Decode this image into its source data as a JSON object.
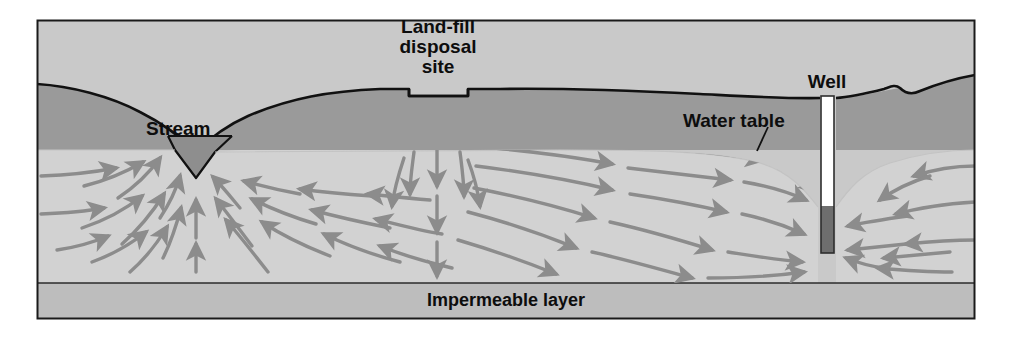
{
  "figure": {
    "kind": "cross-section-diagram",
    "frame": {
      "x": 37,
      "y": 20,
      "width": 938,
      "height": 299,
      "border_color": "#1a1a1a"
    }
  },
  "labels": {
    "stream": "Stream",
    "landfill_line1": "Land-fill",
    "landfill_line2": "disposal",
    "landfill_line3": "site",
    "well": "Well",
    "water_table": "Water table",
    "impermeable_layer": "Impermeable layer"
  },
  "layers": [
    {
      "name": "sky",
      "label": "",
      "color": "#c9c9c9"
    },
    {
      "name": "unsaturated-zone",
      "label": "",
      "color": "#9a9a9a"
    },
    {
      "name": "saturated-zone",
      "label": "",
      "color": "#d2d2d2"
    },
    {
      "name": "impermeable-layer",
      "label": "Impermeable layer",
      "color": "#bdbdbd"
    }
  ],
  "colors": {
    "sky": "#c9c9c9",
    "unsaturated_zone": "#9a9a9a",
    "saturated_zone": "#d2d2d2",
    "impermeable_layer": "#bdbdbd",
    "ground_line": "#111111",
    "arrow": "#8c8c8c",
    "stream_water": "#8e8e8e",
    "well_casing": "#ffffff",
    "well_water": "#6e6e6e",
    "text": "#0d0d0d",
    "frame_border": "#1a1a1a",
    "page_background": "#ffffff"
  },
  "features": {
    "stream": {
      "name": "stream",
      "x": 196,
      "surface_y": 136
    },
    "landfill": {
      "name": "land-fill-disposal-site",
      "x_left": 409,
      "x_right": 468,
      "floor_y": 96
    },
    "well": {
      "name": "well",
      "x": 827,
      "top_y": 96,
      "bottom_y": 253,
      "water_top_y": 206,
      "width": 13
    },
    "water_table": {
      "name": "water-table",
      "leader_from_x": 768,
      "leader_from_y": 128,
      "leader_to_x": 757,
      "leader_to_y": 150
    }
  },
  "flow_arrows": {
    "description": "Groundwater flow direction arrows in the saturated zone",
    "color": "#8c8c8c",
    "groups": [
      {
        "name": "left-recharge-to-stream",
        "direction": "right-and-up toward stream",
        "count": 9
      },
      {
        "name": "stream-discharge-upward",
        "direction": "upward into stream bed",
        "count": 3
      },
      {
        "name": "stream-to-landfill-divide",
        "direction": "left toward stream",
        "count": 10
      },
      {
        "name": "landfill-plume-down",
        "direction": "downward beneath land-fill",
        "count": 4
      },
      {
        "name": "landfill-to-well",
        "direction": "right toward well",
        "count": 16
      },
      {
        "name": "right-side-to-well",
        "direction": "left toward well",
        "count": 9
      }
    ]
  }
}
